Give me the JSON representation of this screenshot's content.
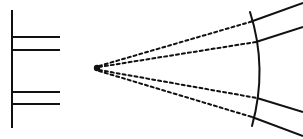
{
  "figure": {
    "type": "line-diagram",
    "canvas": {
      "width": 303,
      "height": 139,
      "background": "#ffffff"
    },
    "stroke_color": "#111111",
    "stroke_width": 2.0,
    "dash_pattern": "3 3"
  },
  "chart_data": {
    "type": "line",
    "xlabel": "",
    "ylabel": "",
    "xlim": [
      0,
      303
    ],
    "ylim": [
      139,
      0
    ],
    "grid": false,
    "legend": "none",
    "elements": [
      {
        "name": "left-vertical-bar",
        "style": "solid",
        "points": [
          [
            12,
            10
          ],
          [
            12,
            128
          ]
        ]
      },
      {
        "name": "left-horizontal-line-1",
        "style": "solid",
        "points": [
          [
            12,
            37
          ],
          [
            60,
            37
          ]
        ]
      },
      {
        "name": "left-horizontal-line-2",
        "style": "solid",
        "points": [
          [
            12,
            50
          ],
          [
            60,
            50
          ]
        ]
      },
      {
        "name": "left-horizontal-line-3",
        "style": "solid",
        "points": [
          [
            12,
            92
          ],
          [
            60,
            92
          ]
        ]
      },
      {
        "name": "left-horizontal-line-4",
        "style": "solid",
        "points": [
          [
            12,
            104
          ],
          [
            60,
            104
          ]
        ]
      },
      {
        "name": "source-point",
        "style": "dot",
        "center": [
          97,
          68
        ],
        "radius": 3.2
      },
      {
        "name": "dashed-ray-1",
        "style": "dashed",
        "points": [
          [
            99,
            66
          ],
          [
            250,
            22
          ]
        ]
      },
      {
        "name": "dashed-ray-2",
        "style": "dashed",
        "points": [
          [
            99,
            67
          ],
          [
            256,
            42
          ]
        ]
      },
      {
        "name": "dashed-ray-3",
        "style": "dashed",
        "points": [
          [
            99,
            70
          ],
          [
            257,
            98
          ]
        ]
      },
      {
        "name": "dashed-ray-4",
        "style": "dashed",
        "points": [
          [
            99,
            71
          ],
          [
            252,
            117
          ]
        ]
      },
      {
        "name": "wavefront-arc",
        "style": "solid-curve",
        "start": [
          250,
          12
        ],
        "control": [
          268,
          68
        ],
        "end": [
          252,
          126
        ]
      },
      {
        "name": "solid-ray-1",
        "style": "solid",
        "points": [
          [
            250,
            22
          ],
          [
            303,
            3
          ]
        ]
      },
      {
        "name": "solid-ray-2",
        "style": "solid",
        "points": [
          [
            256,
            42
          ],
          [
            303,
            27
          ]
        ]
      },
      {
        "name": "solid-ray-3",
        "style": "solid",
        "points": [
          [
            257,
            98
          ],
          [
            303,
            112
          ]
        ]
      },
      {
        "name": "solid-ray-4",
        "style": "solid",
        "points": [
          [
            252,
            117
          ],
          [
            303,
            136
          ]
        ]
      }
    ]
  }
}
